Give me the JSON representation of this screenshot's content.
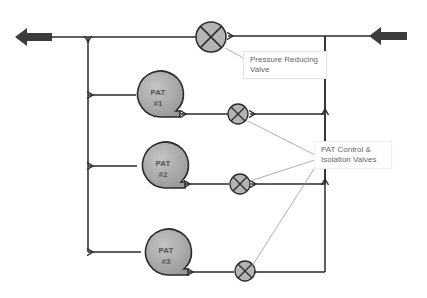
{
  "diagram": {
    "title": "",
    "colors": {
      "line": "#2b2b2b",
      "pump_fill": "#a8a8a8",
      "valve_fill": "#b4b4b4",
      "arrow_fill": "#3c3c3c",
      "callout_line": "#9a9a9a"
    },
    "labels": {
      "prv_line1": "Pressure Reducing",
      "prv_line2": "Valve",
      "pat_valves_line1": "PAT Control &",
      "pat_valves_line2": "Isolation Valves"
    },
    "pumps": [
      {
        "line1": "PAT",
        "line2": "#1"
      },
      {
        "line1": "PAT",
        "line2": "#2"
      },
      {
        "line1": "PAT",
        "line2": "#3"
      }
    ],
    "components": [
      {
        "id": "inlet",
        "type": "flow-arrow",
        "direction": "left"
      },
      {
        "id": "pressure-reducing-valve",
        "type": "valve"
      },
      {
        "id": "pat1-valve",
        "type": "valve"
      },
      {
        "id": "pat2-valve",
        "type": "valve"
      },
      {
        "id": "pat3-valve",
        "type": "valve"
      },
      {
        "id": "outlet",
        "type": "flow-arrow",
        "direction": "left"
      }
    ]
  }
}
